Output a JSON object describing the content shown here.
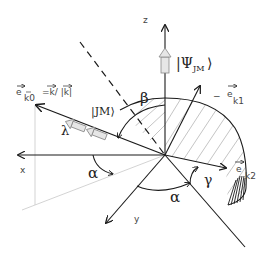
{
  "diagram": {
    "axes": {
      "x": "x",
      "y": "y",
      "z": "z"
    },
    "labels": {
      "psi": "|Ψ",
      "psi_sub": "JM",
      "psi_close": "⟩",
      "jm": "|JM⟩",
      "beta": "β",
      "alpha_left": "α",
      "alpha_bottom": "α",
      "gamma": "γ",
      "lambda": "λ",
      "ek0": "e",
      "ek0_sub": "k0",
      "ek0_def": "=k/ |k|",
      "ek1_prefix": "−",
      "ek1": "e",
      "ek1_sub": "k1",
      "ek2": "e",
      "ek2_sub": "k2"
    },
    "colors": {
      "line": "#1a1a1a",
      "hatch": "#b5b5b5",
      "arrow_fill": "#e6e6e6",
      "faint": "#c8c8c8"
    }
  }
}
